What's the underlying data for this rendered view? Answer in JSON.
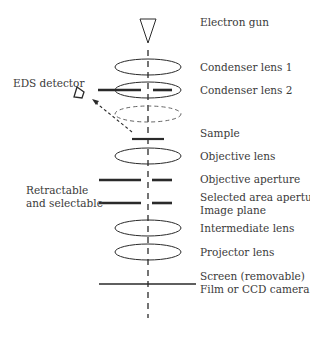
{
  "diagram": {
    "labels": {
      "electron_gun": "Electron gun",
      "condenser_lens_1": "Condenser lens 1",
      "condenser_lens_2": "Condenser lens 2",
      "eds_detector": "EDS detector",
      "sample": "Sample",
      "objective_lens": "Objective lens",
      "objective_aperture": "Objective aperture",
      "retractable_line1": "Retractable",
      "retractable_line2": "and selectable",
      "selected_area_aperture": "Selected area aperture",
      "image_plane": "Image plane",
      "intermediate_lens": "Intermediate lens",
      "projector_lens": "Projector lens",
      "screen": "Screen (removable)",
      "film_camera": "Film or CCD camera"
    },
    "colors": {
      "line": "#2a2a2a",
      "text": "#3a3a3a",
      "dashed_lens": "#666666"
    }
  }
}
